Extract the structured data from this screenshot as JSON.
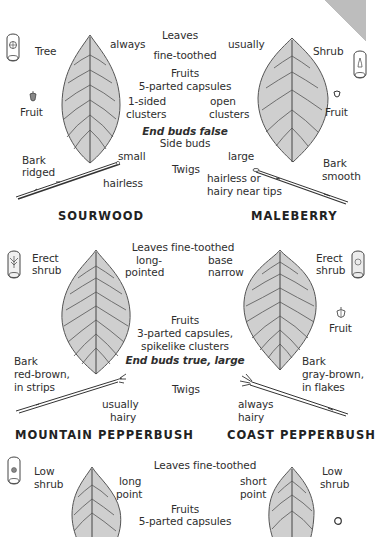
{
  "page": {
    "corner_tab_color": "#b3b3b3",
    "leaf_fill": "#cfcfcf",
    "leaf_stroke": "#555555"
  },
  "section1": {
    "shared": {
      "leaves_label": "Leaves",
      "leaves_detail": "fine-toothed",
      "fruits_label": "Fruits",
      "fruits_detail": "5-parted capsules",
      "end_buds": "End buds false",
      "side_buds": "Side buds",
      "twigs": "Twigs"
    },
    "left": {
      "name": "SOURWOOD",
      "habit": "Tree",
      "habit_icon": "tree-habit-icon",
      "fruit_label": "Fruit",
      "leaf_note": "always",
      "fruit_note_line1": "1-sided",
      "fruit_note_line2": "clusters",
      "bud_note": "small",
      "twig_note": "hairless",
      "bark_line1": "Bark",
      "bark_line2": "ridged"
    },
    "right": {
      "name": "MALEBERRY",
      "habit": "Shrub",
      "habit_icon": "shrub-habit-icon",
      "fruit_label": "Fruit",
      "leaf_note": "usually",
      "fruit_note_line1": "open",
      "fruit_note_line2": "clusters",
      "bud_note": "large",
      "twig_note_line1": "hairless or",
      "twig_note_line2": "hairy near tips",
      "bark_line1": "Bark",
      "bark_line2": "smooth"
    }
  },
  "section2": {
    "shared": {
      "leaves": "Leaves fine-toothed",
      "fruits_label": "Fruits",
      "fruits_line1": "3-parted capsules,",
      "fruits_line2": "spikelike clusters",
      "end_buds": "End buds true, large",
      "twigs": "Twigs"
    },
    "left": {
      "name": "MOUNTAIN PEPPERBUSH",
      "habit_line1": "Erect",
      "habit_line2": "shrub",
      "leaf_note_line1": "long-",
      "leaf_note_line2": "pointed",
      "bark_line1": "Bark",
      "bark_line2": "red-brown,",
      "bark_line3": "in strips",
      "twig_note_line1": "usually",
      "twig_note_line2": "hairy"
    },
    "right": {
      "name": "COAST PEPPERBUSH",
      "habit_line1": "Erect",
      "habit_line2": "shrub",
      "fruit_label": "Fruit",
      "leaf_note_line1": "base",
      "leaf_note_line2": "narrow",
      "bark_line1": "Bark",
      "bark_line2": "gray-brown,",
      "bark_line3": "in flakes",
      "twig_note_line1": "always",
      "twig_note_line2": "hairy"
    }
  },
  "section3": {
    "shared": {
      "leaves": "Leaves fine-toothed",
      "fruits_label": "Fruits",
      "fruits_detail": "5-parted capsules"
    },
    "left": {
      "habit_line1": "Low",
      "habit_line2": "shrub",
      "leaf_note_line1": "long",
      "leaf_note_line2": "point"
    },
    "right": {
      "habit_line1": "Low",
      "habit_line2": "shrub",
      "leaf_note_line1": "short",
      "leaf_note_line2": "point"
    }
  }
}
